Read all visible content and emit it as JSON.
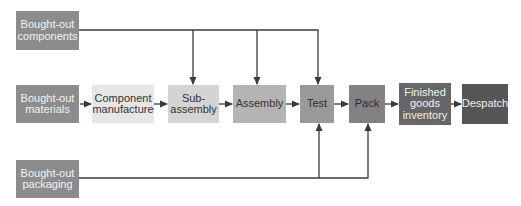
{
  "diagram": {
    "title": "",
    "inputs": {
      "components": {
        "label": "Bought-out\ncomponents",
        "color": "#8c8c8c",
        "text_color": "#f2f2f2"
      },
      "materials": {
        "label": "Bought-out\nmaterials",
        "color": "#8c8c8c",
        "text_color": "#f2f2f2"
      },
      "packaging": {
        "label": "Bought-out\npackaging",
        "color": "#8c8c8c",
        "text_color": "#f2f2f2"
      }
    },
    "stages": [
      {
        "id": "component-manufacture",
        "label": "Component\nmanufacture",
        "color": "#e6e6e6",
        "text_color": "#333333"
      },
      {
        "id": "sub-assembly",
        "label": "Sub-\nassembly",
        "color": "#d4d4d4",
        "text_color": "#333333"
      },
      {
        "id": "assembly",
        "label": "Assembly",
        "color": "#b4b4b4",
        "text_color": "#333333"
      },
      {
        "id": "test",
        "label": "Test",
        "color": "#9a9a9a",
        "text_color": "#2b2b2b"
      },
      {
        "id": "pack",
        "label": "Pack",
        "color": "#828282",
        "text_color": "#2b2b2b"
      },
      {
        "id": "finished-goods-inventory",
        "label": "Finished\ngoods\ninventory",
        "color": "#666666",
        "text_color": "#f0f0f0"
      },
      {
        "id": "despatch",
        "label": "Despatch",
        "color": "#555555",
        "text_color": "#f0f0f0"
      }
    ],
    "flows": [
      {
        "from": "Bought-out materials",
        "to": "Component manufacture"
      },
      {
        "from": "Component manufacture",
        "to": "Sub-assembly"
      },
      {
        "from": "Sub-assembly",
        "to": "Assembly"
      },
      {
        "from": "Assembly",
        "to": "Test"
      },
      {
        "from": "Test",
        "to": "Pack"
      },
      {
        "from": "Pack",
        "to": "Finished goods inventory"
      },
      {
        "from": "Finished goods inventory",
        "to": "Despatch"
      },
      {
        "from": "Bought-out components",
        "to": "Sub-assembly"
      },
      {
        "from": "Bought-out components",
        "to": "Assembly"
      },
      {
        "from": "Bought-out components",
        "to": "Test"
      },
      {
        "from": "Bought-out packaging",
        "to": "Test"
      },
      {
        "from": "Bought-out packaging",
        "to": "Pack"
      }
    ],
    "line_color": "#3a3a3a"
  }
}
